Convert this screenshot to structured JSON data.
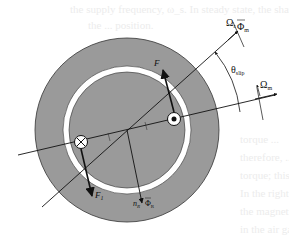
{
  "background_text": [
    {
      "text": "the supply frequency, ω_s. In steady state, the shaft",
      "x": 70,
      "y": 2
    },
    {
      "text": "the ... position.",
      "x": 88,
      "y": 18
    },
    {
      "text": "torque ...",
      "x": 240,
      "y": 132
    },
    {
      "text": "therefore, ...",
      "x": 240,
      "y": 150
    },
    {
      "text": "torque; this ...",
      "x": 240,
      "y": 168
    },
    {
      "text": "In the right ...",
      "x": 240,
      "y": 186
    },
    {
      "text": "the magnetic ...",
      "x": 240,
      "y": 204
    },
    {
      "text": "in the air gap. ...",
      "x": 240,
      "y": 222
    }
  ],
  "diagram": {
    "labels": {
      "omega_r": "Ω",
      "omega_r_sub": "r",
      "phi_m": "Φ",
      "phi_m_sub": "m",
      "theta_slip": "θ",
      "theta_slip_sub": "slip",
      "omega_m": "Ω",
      "omega_m_sub": "m",
      "force_upper": "F",
      "force_upper_sub": "",
      "force_lower": "F",
      "force_lower_sub": "1",
      "n_R": "n",
      "n_R_sub": "R",
      "phi_R": "Φ",
      "phi_R_sub": "R"
    },
    "conductors": [
      {
        "name": "current-into-page",
        "symbol": "⊗"
      },
      {
        "name": "current-out-of-page",
        "symbol": "⊙"
      }
    ],
    "colors": {
      "stator": "#9a9a9a",
      "rotor": "#9a9a9a",
      "air_gap": "#ffffff",
      "lines": "#1a1a1a"
    }
  }
}
